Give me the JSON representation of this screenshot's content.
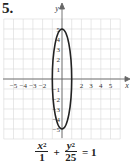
{
  "problem_number": "5.",
  "equation": {
    "term1": {
      "numerator_var": "x",
      "numerator_exp": "2",
      "denominator": "1"
    },
    "plus": "+",
    "term2": {
      "numerator_var": "y",
      "numerator_exp": "2",
      "denominator": "25"
    },
    "equals": "= 1"
  },
  "chart_data": {
    "type": "line",
    "title": "",
    "xlabel": "x",
    "ylabel": "y",
    "xlim": [
      -6,
      6
    ],
    "ylim": [
      -6,
      6
    ],
    "grid": true,
    "x_tick_labels": [
      "-5",
      "-4",
      "-3",
      "-2",
      "2",
      "3",
      "4",
      "5"
    ],
    "y_tick_labels": [
      "5",
      "4",
      "3",
      "2",
      "1",
      "-1",
      "-2",
      "-3",
      "-4",
      "-5"
    ],
    "series": [
      {
        "name": "ellipse",
        "center": [
          0,
          0
        ],
        "semi_axis_x": 1,
        "semi_axis_y": 5,
        "vertices": [
          [
            0,
            5
          ],
          [
            0,
            -5
          ]
        ],
        "co_vertices": [
          [
            1,
            0
          ],
          [
            -1,
            0
          ]
        ]
      }
    ]
  }
}
